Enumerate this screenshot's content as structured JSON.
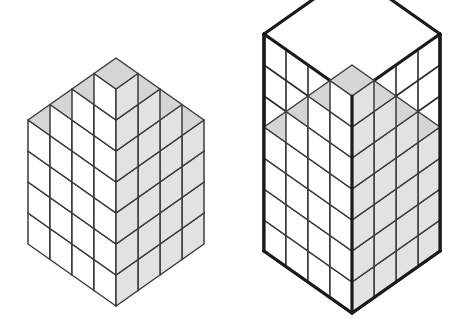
{
  "figure": {
    "kind": "diagram",
    "panels": [
      {
        "id": "left-panel",
        "name": "plain-stack",
        "label": "",
        "has_bounding_box": false
      },
      {
        "id": "right-panel",
        "name": "boxed-stack",
        "label": "",
        "has_bounding_box": true
      }
    ]
  },
  "geometry": {
    "grid_cols": 4,
    "grid_rows": 4,
    "height_map": [
      [
        7,
        6,
        5,
        4
      ],
      [
        6,
        5,
        4,
        3
      ],
      [
        5,
        4,
        3,
        2
      ],
      [
        4,
        3,
        2,
        1
      ]
    ],
    "height_map_note": "rows = depth (back to front), cols = left to right; values = stack height in cubes",
    "cube_half_width": 22,
    "cube_height": 31,
    "box_cols": 4,
    "box_rows": 4,
    "box_levels": 7,
    "left_origin": {
      "x": 116,
      "y": 306
    },
    "right_origin": {
      "x": 352,
      "y": 313
    }
  },
  "colors": {
    "background": "#ffffff",
    "face_top": "#d5d5d5",
    "face_left": "#ffffff",
    "face_right": "#e2e2e2",
    "edge": "#3b3b3b",
    "box_edge": "#1a1a1a",
    "box_edge_thin": "#2b2b2b"
  },
  "stroke": {
    "cube_edge_width": 1.5,
    "box_edge_width": 3.2,
    "box_grid_width": 1.6
  },
  "counts": {
    "total_cubes": 70,
    "box_capacity": 112,
    "missing_cubes": 42
  }
}
